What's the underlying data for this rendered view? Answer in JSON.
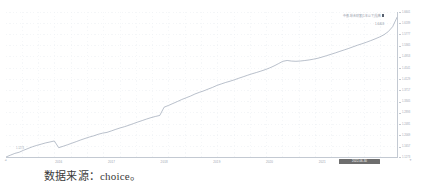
{
  "caption": {
    "text": "数据来源：choice。"
  },
  "legend": {
    "label": "中债-综合财富(1年以下)指数",
    "swatch_color": "#58606e"
  },
  "annotations": {
    "last_value": "1.6403",
    "start_value": "1.1273",
    "selected_date_chip": "2022-06-30",
    "axis_arrow_left": "◄",
    "axis_arrow_right": "▼"
  },
  "colors": {
    "line": "#8a95a8",
    "grid": "#e9edf2",
    "axis": "#c3c9d2",
    "tick_text": "#9aa2ae",
    "chip_background": "#6e6e6e",
    "background": "#ffffff"
  },
  "chart_data": {
    "type": "line",
    "title": "",
    "subtitle": "",
    "xlabel": "",
    "ylabel": "",
    "grid": true,
    "legend_position": "top-right",
    "xlim": [
      "2015-01",
      "2022-06"
    ],
    "ylim": [
      1.1273,
      1.6601
    ],
    "xticks": [
      "2016",
      "2017",
      "2018",
      "2019",
      "2020",
      "2021"
    ],
    "yticks": [
      "1.6601",
      "1.6189",
      "1.5777",
      "1.5365",
      "1.4953",
      "1.4541",
      "1.4129",
      "1.3717",
      "1.3305",
      "1.2893",
      "1.2481",
      "1.2069",
      "1.1657",
      "1.1273"
    ],
    "series": [
      {
        "name": "中债-综合财富(1年以下)指数",
        "color": "#8a95a8",
        "x": [
          "2015-01",
          "2015-02",
          "2015-03",
          "2015-04",
          "2015-05",
          "2015-06",
          "2015-07",
          "2015-08",
          "2015-09",
          "2015-10",
          "2015-11",
          "2015-12",
          "2016-01",
          "2016-02",
          "2016-03",
          "2016-04",
          "2016-05",
          "2016-06",
          "2016-07",
          "2016-08",
          "2016-09",
          "2016-10",
          "2016-11",
          "2016-12",
          "2017-01",
          "2017-02",
          "2017-03",
          "2017-04",
          "2017-05",
          "2017-06",
          "2017-07",
          "2017-08",
          "2017-09",
          "2017-10",
          "2017-11",
          "2017-12",
          "2018-01",
          "2018-02",
          "2018-03",
          "2018-04",
          "2018-05",
          "2018-06",
          "2018-07",
          "2018-08",
          "2018-09",
          "2018-10",
          "2018-11",
          "2018-12",
          "2019-01",
          "2019-02",
          "2019-03",
          "2019-04",
          "2019-05",
          "2019-06",
          "2019-07",
          "2019-08",
          "2019-09",
          "2019-10",
          "2019-11",
          "2019-12",
          "2020-01",
          "2020-02",
          "2020-03",
          "2020-04",
          "2020-05",
          "2020-06",
          "2020-07",
          "2020-08",
          "2020-09",
          "2020-10",
          "2020-11",
          "2020-12",
          "2021-01",
          "2021-02",
          "2021-03",
          "2021-04",
          "2021-05",
          "2021-06",
          "2021-07",
          "2021-08",
          "2021-09",
          "2021-10",
          "2021-11",
          "2021-12",
          "2022-01",
          "2022-02",
          "2022-03",
          "2022-04",
          "2022-05",
          "2022-06"
        ],
        "values": [
          1.1273,
          1.134,
          1.1405,
          1.1448,
          1.152,
          1.1585,
          1.1648,
          1.17,
          1.1744,
          1.179,
          1.1825,
          1.1862,
          1.1615,
          1.1668,
          1.1722,
          1.178,
          1.1838,
          1.19,
          1.1955,
          1.2008,
          1.2052,
          1.2108,
          1.215,
          1.2178,
          1.2232,
          1.229,
          1.2342,
          1.2388,
          1.2442,
          1.25,
          1.2558,
          1.2612,
          1.2668,
          1.2718,
          1.2762,
          1.28,
          1.3105,
          1.3168,
          1.324,
          1.331,
          1.3385,
          1.3448,
          1.3512,
          1.3588,
          1.3648,
          1.3702,
          1.3768,
          1.383,
          1.3902,
          1.3958,
          1.4012,
          1.4058,
          1.411,
          1.4168,
          1.4222,
          1.4278,
          1.433,
          1.4378,
          1.4428,
          1.4482,
          1.4545,
          1.4618,
          1.4702,
          1.4788,
          1.482,
          1.4798,
          1.479,
          1.48,
          1.4818,
          1.484,
          1.4868,
          1.4902,
          1.4948,
          1.4998,
          1.5048,
          1.51,
          1.5155,
          1.5208,
          1.5262,
          1.5322,
          1.538,
          1.5432,
          1.5488,
          1.5548,
          1.5612,
          1.568,
          1.5762,
          1.5878,
          1.606,
          1.6403
        ]
      }
    ]
  }
}
